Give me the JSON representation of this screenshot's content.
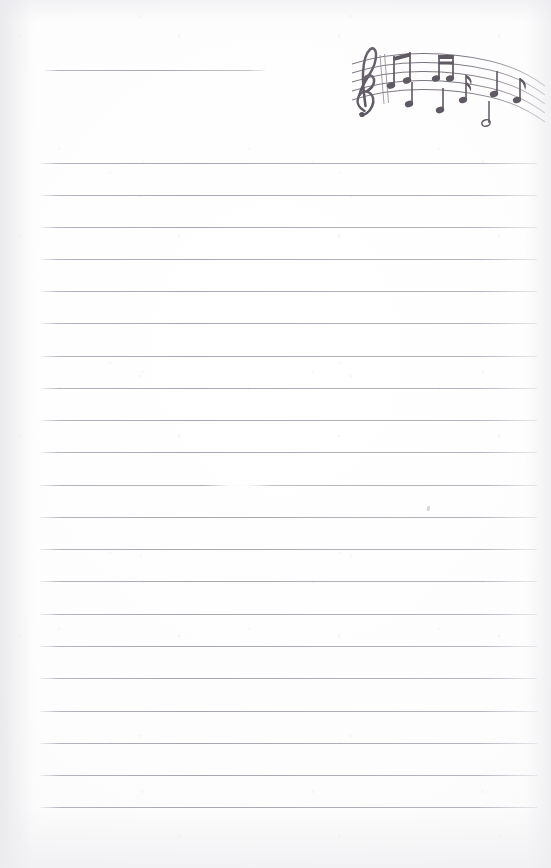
{
  "document": {
    "type": "lined-stationery-sheet",
    "title_line_present": true,
    "page_width": 551,
    "page_height": 868,
    "background_color": "#fdfdfd",
    "rule_color": "#9a9ca6",
    "artwork_color": "#6d6770"
  },
  "title_line": {
    "label": "title-write-in-line",
    "x": 45,
    "y": 70,
    "width": 220
  },
  "rules": {
    "label": "ruled-writing-lines",
    "left": 40,
    "right": 537,
    "spacing": 32.2,
    "count": 20,
    "y_positions": [
      163,
      195,
      227,
      259,
      291,
      323,
      356,
      388,
      420,
      452,
      485,
      517,
      549,
      581,
      614,
      646,
      678,
      711,
      743,
      775,
      807
    ],
    "faded_line_index": 10
  },
  "artifacts": {
    "pencil_speck": {
      "x": 427,
      "y": 506
    }
  },
  "artwork": {
    "name": "musical-staff-illustration",
    "description": "Hand-drawn curving five-line musical staff with treble clef and assorted notes",
    "x": 340,
    "y": 28,
    "width": 211,
    "height": 104,
    "elements": [
      {
        "name": "treble-clef-icon"
      },
      {
        "name": "staff-lines"
      },
      {
        "name": "beamed-eighth-note-pair-1"
      },
      {
        "name": "beamed-eighth-note-pair-2"
      },
      {
        "name": "quarter-note-1"
      },
      {
        "name": "quarter-note-2"
      },
      {
        "name": "quarter-note-3"
      },
      {
        "name": "eighth-note-flagged-1"
      },
      {
        "name": "eighth-note-flagged-2"
      },
      {
        "name": "half-note-1"
      }
    ]
  }
}
